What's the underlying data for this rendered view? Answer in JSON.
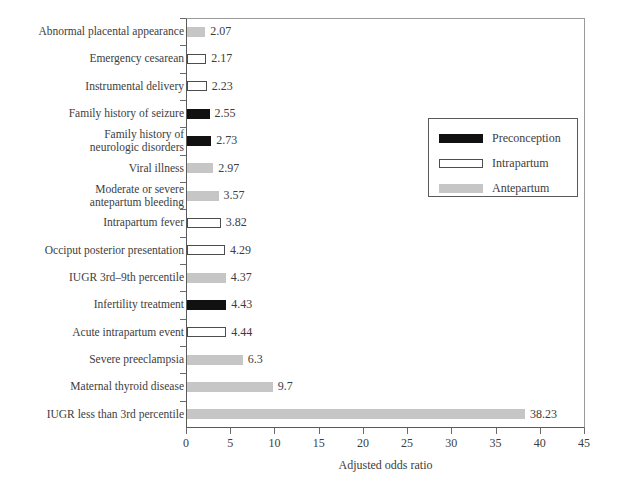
{
  "chart_data": {
    "type": "bar",
    "orientation": "horizontal",
    "title": "",
    "xlabel": "Adjusted odds ratio",
    "ylabel": "",
    "xlim": [
      0,
      45
    ],
    "xticks": [
      0,
      5,
      10,
      15,
      20,
      25,
      30,
      35,
      40,
      45
    ],
    "grid": false,
    "legend_position": "upper right",
    "legend": [
      {
        "name": "Preconception",
        "color": "#111111",
        "style": "filled-black"
      },
      {
        "name": "Intrapartum",
        "color": "#ffffff",
        "style": "white-outlined"
      },
      {
        "name": "Antepartum",
        "color": "#c6c6c6",
        "style": "filled-gray"
      }
    ],
    "categories": [
      "Abnormal placental appearance",
      "Emergency cesarean",
      "Instrumental delivery",
      "Family history of seizure",
      "Family history of\nneurologic disorders",
      "Viral illness",
      "Moderate or severe\nantepartum bleeding",
      "Intrapartum fever",
      "Occiput posterior presentation",
      "IUGR 3rd–9th percentile",
      "Infertility treatment",
      "Acute intrapartum event",
      "Severe preeclampsia",
      "Maternal thyroid disease",
      "IUGR less than 3rd percentile"
    ],
    "values": [
      2.07,
      2.17,
      2.23,
      2.55,
      2.73,
      2.97,
      3.57,
      3.82,
      4.29,
      4.37,
      4.43,
      4.44,
      6.3,
      9.7,
      38.23
    ],
    "value_labels": [
      "2.07",
      "2.17",
      "2.23",
      "2.55",
      "2.73",
      "2.97",
      "3.57",
      "3.82",
      "4.29",
      "4.37",
      "4.43",
      "4.44",
      "6.3",
      "9.7",
      "38.23"
    ],
    "groups": [
      "Antepartum",
      "Intrapartum",
      "Intrapartum",
      "Preconception",
      "Preconception",
      "Antepartum",
      "Antepartum",
      "Intrapartum",
      "Intrapartum",
      "Antepartum",
      "Preconception",
      "Intrapartum",
      "Antepartum",
      "Antepartum",
      "Antepartum"
    ],
    "bars": [
      {
        "category": "Abnormal placental appearance",
        "value": 2.07,
        "label": "2.07",
        "group": "Antepartum"
      },
      {
        "category": "Emergency cesarean",
        "value": 2.17,
        "label": "2.17",
        "group": "Intrapartum"
      },
      {
        "category": "Instrumental delivery",
        "value": 2.23,
        "label": "2.23",
        "group": "Intrapartum"
      },
      {
        "category": "Family history of seizure",
        "value": 2.55,
        "label": "2.55",
        "group": "Preconception"
      },
      {
        "category": "Family history of\nneurologic disorders",
        "value": 2.73,
        "label": "2.73",
        "group": "Preconception"
      },
      {
        "category": "Viral illness",
        "value": 2.97,
        "label": "2.97",
        "group": "Antepartum"
      },
      {
        "category": "Moderate or severe\nantepartum bleeding",
        "value": 3.57,
        "label": "3.57",
        "group": "Antepartum"
      },
      {
        "category": "Intrapartum fever",
        "value": 3.82,
        "label": "3.82",
        "group": "Intrapartum"
      },
      {
        "category": "Occiput posterior presentation",
        "value": 4.29,
        "label": "4.29",
        "group": "Intrapartum"
      },
      {
        "category": "IUGR 3rd–9th percentile",
        "value": 4.37,
        "label": "4.37",
        "group": "Antepartum"
      },
      {
        "category": "Infertility treatment",
        "value": 4.43,
        "label": "4.43",
        "group": "Preconception"
      },
      {
        "category": "Acute intrapartum event",
        "value": 4.44,
        "label": "4.44",
        "group": "Intrapartum"
      },
      {
        "category": "Severe preeclampsia",
        "value": 6.3,
        "label": "6.3",
        "group": "Antepartum"
      },
      {
        "category": "Maternal thyroid disease",
        "value": 9.7,
        "label": "9.7",
        "group": "Antepartum"
      },
      {
        "category": "IUGR less than 3rd percentile",
        "value": 38.23,
        "label": "38.23",
        "group": "Antepartum"
      }
    ]
  },
  "colors": {
    "preconception": "#111111",
    "intrapartum": "#ffffff",
    "antepartum": "#c6c6c6",
    "axis": "#5a5a5a",
    "text": "#3d3d3d",
    "background": "#ffffff"
  }
}
